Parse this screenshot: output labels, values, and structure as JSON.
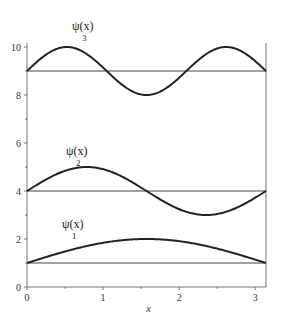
{
  "chart_data": {
    "type": "line",
    "title": "",
    "xlabel": "x",
    "ylabel": "",
    "xlim": [
      0,
      3.14159
    ],
    "ylim": [
      0,
      10
    ],
    "xticks": [
      0,
      1,
      2,
      3
    ],
    "yticks": [
      0,
      2,
      4,
      6,
      8,
      10
    ],
    "grid": false,
    "series": [
      {
        "name": "ψ1(x)",
        "label_main": "ψ(x)",
        "label_sub": "1",
        "baseline": 1,
        "formula": "1 + sin(x)",
        "x": [
          0,
          0.785,
          1.571,
          2.356,
          3.142
        ],
        "values": [
          1,
          1.71,
          2,
          1.71,
          1
        ]
      },
      {
        "name": "ψ2(x)",
        "label_main": "ψ(x)",
        "label_sub": "2",
        "baseline": 4,
        "formula": "4 + sin(2x)",
        "x": [
          0,
          0.785,
          1.571,
          2.356,
          3.142
        ],
        "values": [
          4,
          5,
          4,
          3,
          4
        ]
      },
      {
        "name": "ψ3(x)",
        "label_main": "ψ(x)",
        "label_sub": "3",
        "baseline": 9,
        "formula": "9 + sin(3x)",
        "x": [
          0,
          0.524,
          1.047,
          1.571,
          2.094,
          2.618,
          3.142
        ],
        "values": [
          9,
          10,
          9,
          8,
          9,
          10,
          9
        ]
      }
    ]
  }
}
